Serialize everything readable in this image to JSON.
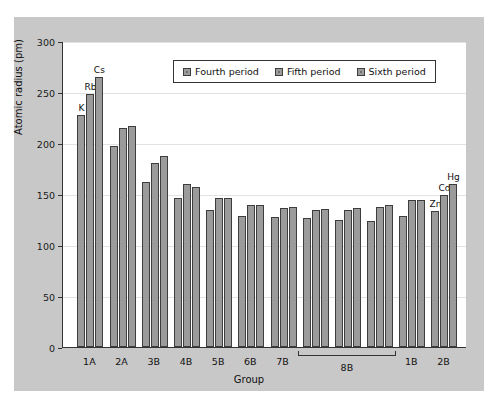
{
  "chart_data": {
    "type": "bar",
    "title": "",
    "xlabel": "Group",
    "ylabel": "Atomic radius (pm)",
    "ylim": [
      0,
      300
    ],
    "yticks": [
      0,
      50,
      100,
      150,
      200,
      250,
      300
    ],
    "grid": true,
    "legend_position": "top-center",
    "categories": [
      "1A",
      "2A",
      "3B",
      "4B",
      "5B",
      "6B",
      "7B",
      "8B",
      "8B",
      "8B",
      "1B",
      "2B"
    ],
    "axis_tick_labels": [
      "1A",
      "2A",
      "3B",
      "4B",
      "5B",
      "6B",
      "7B",
      "8B",
      "1B",
      "2B"
    ],
    "bracket_label": "8B",
    "series": [
      {
        "name": "Fourth period",
        "values": [
          227,
          197,
          162,
          146,
          134,
          128,
          127,
          126,
          125,
          124,
          128,
          133
        ]
      },
      {
        "name": "Fifth period",
        "values": [
          248,
          215,
          180,
          160,
          146,
          139,
          136,
          134,
          134,
          137,
          144,
          149
        ]
      },
      {
        "name": "Sixth period",
        "values": [
          265,
          217,
          187,
          157,
          146,
          139,
          137,
          135,
          136,
          139,
          144,
          160
        ]
      }
    ],
    "point_labels": [
      {
        "group": 0,
        "series": 0,
        "text": "K"
      },
      {
        "group": 0,
        "series": 1,
        "text": "Rb"
      },
      {
        "group": 0,
        "series": 2,
        "text": "Cs"
      },
      {
        "group": 11,
        "series": 0,
        "text": "Zn"
      },
      {
        "group": 11,
        "series": 1,
        "text": "Cd"
      },
      {
        "group": 11,
        "series": 2,
        "text": "Hg"
      }
    ],
    "colors": {
      "bar_fill": "#9b9b9b",
      "bar_edge": "#3d3d3d",
      "panel_background": "#c8c8c8",
      "plot_background": "#ffffff",
      "gridline": "#e2e2e2",
      "axis": "#333333",
      "text": "#111111"
    }
  },
  "legend": {
    "items": [
      {
        "label": "Fourth period"
      },
      {
        "label": "Fifth period"
      },
      {
        "label": "Sixth period"
      }
    ]
  }
}
